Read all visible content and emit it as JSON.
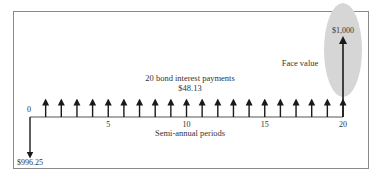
{
  "diagram": {
    "type": "cash-flow-timeline",
    "payments_label": "20 bond interest payments",
    "payment_amount": "$48.13",
    "face_value_label": "Face value",
    "face_value_amount": "$1,000",
    "price_amount": "$996.25",
    "axis_label": "Semi-annual periods",
    "start_label": "0",
    "ticks": [
      {
        "period": 5,
        "label": "5"
      },
      {
        "period": 10,
        "label": "10"
      },
      {
        "period": 15,
        "label": "15"
      },
      {
        "period": 20,
        "label": "20"
      }
    ],
    "num_periods": 20,
    "colors": {
      "frame": "#8a8a8a",
      "ink": "#1a1a1a",
      "highlight": "#d6d6d6",
      "text": "#333333"
    }
  }
}
